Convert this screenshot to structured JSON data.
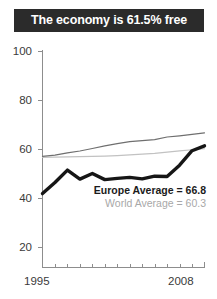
{
  "title": "The economy is 61.5% free",
  "legend": {
    "europe": "Europe Average = 66.8",
    "world": "World Average = 60.3"
  },
  "axes": {
    "y_ticks": [
      "100",
      "80",
      "60",
      "40",
      "20"
    ],
    "x_start": "1995",
    "x_end": "2008"
  },
  "colors": {
    "title_band": "#2b2b2b",
    "title_text": "#ffffff",
    "country_line": "#161616",
    "europe_line": "#6f6f6f",
    "world_line": "#c2c2c2",
    "axis": "#8d8d8d",
    "tick_text": "#3a3a3a"
  },
  "chart_data": {
    "type": "line",
    "title": "The economy is 61.5% free",
    "xlabel": "",
    "ylabel": "",
    "xlim": [
      1995,
      2008
    ],
    "ylim": [
      0,
      100
    ],
    "yticks": [
      20,
      40,
      60,
      80,
      100
    ],
    "xticks": [
      1995,
      1996,
      1997,
      1998,
      1999,
      2000,
      2001,
      2002,
      2003,
      2004,
      2005,
      2006,
      2007,
      2008
    ],
    "grid": false,
    "legend_position": "inside-lower-right",
    "x": [
      1995,
      1996,
      1997,
      1998,
      1999,
      2000,
      2001,
      2002,
      2003,
      2004,
      2005,
      2006,
      2007,
      2008
    ],
    "series": [
      {
        "name": "Country economic freedom",
        "color": "#161616",
        "style": "thick",
        "values": [
          42.0,
          46.5,
          51.6,
          47.9,
          50.2,
          47.7,
          48.2,
          48.6,
          48.0,
          49.1,
          49.0,
          53.6,
          59.5,
          61.5
        ]
      },
      {
        "name": "Europe Average = 66.8",
        "color": "#6f6f6f",
        "style": "thin",
        "values": [
          57.2,
          57.7,
          58.6,
          59.4,
          60.4,
          61.5,
          62.4,
          63.2,
          63.6,
          64.0,
          65.1,
          65.6,
          66.2,
          66.8
        ]
      },
      {
        "name": "World Average = 60.3",
        "color": "#c2c2c2",
        "style": "thin",
        "values": [
          56.8,
          56.9,
          57.0,
          57.1,
          57.2,
          57.3,
          57.5,
          57.8,
          58.1,
          58.4,
          58.9,
          59.4,
          59.9,
          60.3
        ]
      }
    ]
  }
}
